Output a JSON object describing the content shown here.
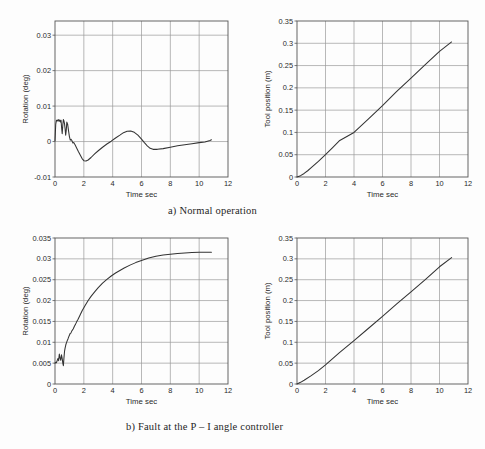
{
  "document": {
    "type": "figure-page",
    "background": "#fdfdfd",
    "ink_color": "#1f1f1f"
  },
  "captions": [
    {
      "id": "a",
      "text": "a) Normal operation"
    },
    {
      "id": "b",
      "text": "b) Fault at the P – I angle controller"
    }
  ],
  "chart_data": [
    {
      "id": "panel-a-rotation",
      "type": "line",
      "title": "",
      "xlabel": "Time  sec",
      "ylabel": "Rotation  (deg)",
      "xlim": [
        0,
        12
      ],
      "ylim": [
        -0.01,
        0.034
      ],
      "xticks": [
        0,
        2,
        4,
        6,
        8,
        10,
        12
      ],
      "xticklabels": [
        "0",
        "2",
        "4",
        "6",
        "8",
        "10",
        "12"
      ],
      "yticks": [
        -0.01,
        0,
        0.01,
        0.02,
        0.03
      ],
      "yticklabels": [
        "-0.01",
        "0",
        "0.01",
        "0.02",
        "0.03"
      ],
      "grid": true,
      "legend": "none",
      "series": [
        {
          "name": "rotation",
          "color": "#333333",
          "x": [
            0.0,
            0.05,
            0.1,
            0.16,
            0.22,
            0.28,
            0.33,
            0.38,
            0.42,
            0.46,
            0.5,
            0.54,
            0.58,
            0.62,
            0.66,
            0.7,
            0.74,
            0.78,
            0.82,
            0.88,
            0.94,
            1.0,
            1.06,
            1.12,
            1.18,
            1.24,
            1.3,
            1.4,
            1.5,
            1.62,
            1.75,
            1.88,
            2.0,
            2.15,
            2.3,
            2.5,
            2.75,
            3.0,
            3.3,
            3.6,
            3.9,
            4.2,
            4.5,
            4.75,
            5.0,
            5.25,
            5.5,
            5.75,
            6.0,
            6.2,
            6.4,
            6.6,
            6.8,
            7.1,
            7.5,
            8.0,
            8.5,
            9.0,
            9.5,
            10.0,
            10.4,
            10.75,
            10.85
          ],
          "y": [
            0.0002,
            0.0048,
            0.006,
            0.0058,
            0.0062,
            0.0057,
            0.0061,
            0.0055,
            0.006,
            0.0038,
            0.0022,
            0.0046,
            0.0062,
            0.0058,
            0.005,
            0.0036,
            0.0018,
            0.0031,
            0.0055,
            0.0048,
            0.003,
            0.0014,
            0.0004,
            0.0006,
            0.0002,
            -0.0004,
            -0.0003,
            -0.001,
            -0.0018,
            -0.0028,
            -0.0038,
            -0.0048,
            -0.0054,
            -0.0055,
            -0.0052,
            -0.0045,
            -0.0035,
            -0.0026,
            -0.0016,
            -0.0007,
            0.0001,
            0.001,
            0.0018,
            0.0025,
            0.0029,
            0.003,
            0.0026,
            0.0018,
            0.0007,
            -0.0003,
            -0.0012,
            -0.0019,
            -0.0022,
            -0.0022,
            -0.002,
            -0.0016,
            -0.0012,
            -0.0009,
            -0.0006,
            -0.0003,
            -0.0001,
            0.0003,
            0.0005
          ]
        }
      ]
    },
    {
      "id": "panel-a-tool-position",
      "type": "line",
      "title": "",
      "xlabel": "Time  sec",
      "ylabel": "Tool position  (m)",
      "xlim": [
        0,
        12
      ],
      "ylim": [
        0,
        0.35
      ],
      "xticks": [
        0,
        2,
        4,
        6,
        8,
        10,
        12
      ],
      "xticklabels": [
        "0",
        "2",
        "4",
        "6",
        "8",
        "10",
        "12"
      ],
      "yticks": [
        0,
        0.05,
        0.1,
        0.15,
        0.2,
        0.25,
        0.3,
        0.35
      ],
      "yticklabels": [
        "0",
        "0.05",
        "0.1",
        "0.15",
        "0.2",
        "0.25",
        "0.3",
        "0.35"
      ],
      "grid": true,
      "legend": "none",
      "series": [
        {
          "name": "tool position",
          "color": "#333333",
          "x": [
            0.0,
            0.25,
            0.5,
            0.75,
            1.0,
            1.5,
            2.0,
            2.5,
            3.0,
            3.5,
            4.0,
            5.0,
            6.0,
            7.0,
            8.0,
            9.0,
            10.0,
            10.85
          ],
          "y": [
            0.0,
            0.003,
            0.008,
            0.014,
            0.021,
            0.035,
            0.05,
            0.066,
            0.082,
            0.091,
            0.1,
            0.13,
            0.16,
            0.192,
            0.222,
            0.252,
            0.282,
            0.303
          ]
        }
      ]
    },
    {
      "id": "panel-b-rotation",
      "type": "line",
      "title": "",
      "xlabel": "Time  sec",
      "ylabel": "Rotation  (deg)",
      "xlim": [
        0,
        12
      ],
      "ylim": [
        0,
        0.035
      ],
      "xticks": [
        0,
        2,
        4,
        6,
        8,
        10,
        12
      ],
      "xticklabels": [
        "0",
        "2",
        "4",
        "6",
        "8",
        "10",
        "12"
      ],
      "yticks": [
        0,
        0.005,
        0.01,
        0.015,
        0.02,
        0.025,
        0.03,
        0.035
      ],
      "yticklabels": [
        "0",
        "0.005",
        "0.01",
        "0.015",
        "0.02",
        "0.025",
        "0.03",
        "0.035"
      ],
      "grid": true,
      "legend": "none",
      "series": [
        {
          "name": "rotation",
          "color": "#333333",
          "x": [
            0.0,
            0.05,
            0.1,
            0.15,
            0.2,
            0.25,
            0.3,
            0.35,
            0.4,
            0.45,
            0.5,
            0.54,
            0.58,
            0.62,
            0.66,
            0.7,
            0.75,
            0.8,
            0.85,
            0.9,
            0.95,
            1.0,
            1.05,
            1.1,
            1.18,
            1.26,
            1.34,
            1.42,
            1.5,
            1.6,
            1.75,
            1.9,
            2.1,
            2.3,
            2.5,
            2.75,
            3.0,
            3.3,
            3.6,
            3.9,
            4.2,
            4.5,
            4.8,
            5.2,
            5.6,
            6.0,
            6.5,
            7.0,
            7.5,
            8.0,
            8.5,
            9.0,
            9.5,
            10.0,
            10.5,
            10.85
          ],
          "y": [
            0.005,
            0.0052,
            0.0051,
            0.0056,
            0.0061,
            0.0056,
            0.0072,
            0.0062,
            0.0057,
            0.007,
            0.0061,
            0.005,
            0.0044,
            0.0062,
            0.0078,
            0.0086,
            0.0094,
            0.0099,
            0.0104,
            0.0108,
            0.0113,
            0.0117,
            0.0121,
            0.0122,
            0.0128,
            0.0132,
            0.0138,
            0.0143,
            0.0149,
            0.0155,
            0.0166,
            0.0177,
            0.0189,
            0.02,
            0.021,
            0.0221,
            0.0231,
            0.0242,
            0.0251,
            0.0259,
            0.0266,
            0.0272,
            0.0278,
            0.0285,
            0.0291,
            0.0296,
            0.0302,
            0.0306,
            0.0309,
            0.0311,
            0.0313,
            0.0314,
            0.0315,
            0.0316,
            0.0316,
            0.0316
          ]
        }
      ]
    },
    {
      "id": "panel-b-tool-position",
      "type": "line",
      "title": "",
      "xlabel": "Time  sec",
      "ylabel": "Tool position  (m)",
      "xlim": [
        0,
        12
      ],
      "ylim": [
        0,
        0.35
      ],
      "xticks": [
        0,
        2,
        4,
        6,
        8,
        10,
        12
      ],
      "xticklabels": [
        "0",
        "2",
        "4",
        "6",
        "8",
        "10",
        "12"
      ],
      "yticks": [
        0,
        0.05,
        0.1,
        0.15,
        0.2,
        0.25,
        0.3,
        0.35
      ],
      "yticklabels": [
        "0",
        "0.05",
        "0.1",
        "0.15",
        "0.2",
        "0.25",
        "0.3",
        "0.35"
      ],
      "grid": true,
      "legend": "none",
      "series": [
        {
          "name": "tool position",
          "color": "#333333",
          "x": [
            0.0,
            0.25,
            0.5,
            1.0,
            1.5,
            2.0,
            2.5,
            3.0,
            4.0,
            5.0,
            6.0,
            7.0,
            8.0,
            9.0,
            10.0,
            10.85
          ],
          "y": [
            0.0,
            0.004,
            0.009,
            0.02,
            0.032,
            0.046,
            0.061,
            0.076,
            0.104,
            0.133,
            0.162,
            0.192,
            0.221,
            0.25,
            0.281,
            0.303
          ]
        }
      ]
    }
  ]
}
